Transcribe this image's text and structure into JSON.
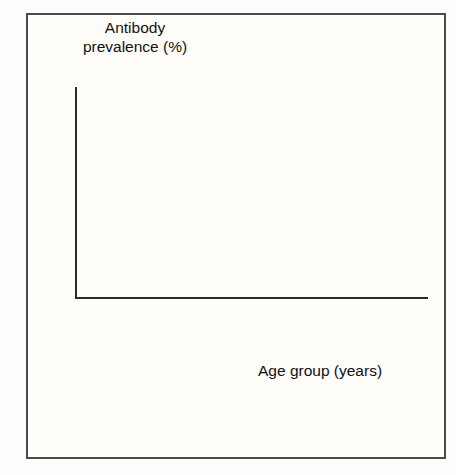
{
  "chart_data": {
    "type": "bar",
    "subtype": "stacked-percentage",
    "title": "",
    "ylabel": "Antibody\nprevalence (%)",
    "xlabel": "Age group (years)",
    "categories": [
      "0–4",
      "5–9",
      "10–14",
      "15–19",
      "20–24",
      "25–29",
      "30–34",
      "35–39",
      "40–44"
    ],
    "ylim": [
      0,
      100
    ],
    "yticks": [
      0,
      20,
      40,
      60,
      80,
      100
    ],
    "ytick_labels": [
      "0",
      "20",
      "40",
      "60",
      "80",
      "100"
    ],
    "grid": false,
    "legend_position": "bottom-left",
    "stack_order_bottom_to_top": [
      "Positive",
      "Equivocal",
      "Negative"
    ],
    "series": [
      {
        "name": "Negative",
        "color": "#e8392c",
        "values": [
          80,
          62,
          44,
          42,
          41,
          41,
          36,
          33,
          32
        ]
      },
      {
        "name": "Equivocal",
        "color": "#11307e",
        "values": [
          5,
          7,
          5,
          7,
          6,
          9,
          9,
          10,
          10
        ]
      },
      {
        "name": "Positive",
        "color": "#efdcb5",
        "values": [
          15,
          31,
          51,
          51,
          53,
          50,
          55,
          57,
          58
        ]
      }
    ]
  },
  "legend": {
    "items": [
      {
        "label": "Negative",
        "color": "#e8392c"
      },
      {
        "label": "Equivocal",
        "color": "#11307e"
      },
      {
        "label": "Positive",
        "color": "#efdcb5"
      }
    ]
  }
}
